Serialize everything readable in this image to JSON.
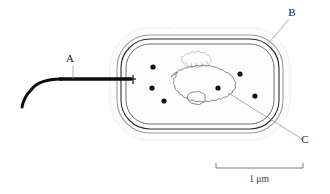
{
  "figure": {
    "background_color": "#ffffff",
    "ink_color": "#1a1a1a"
  },
  "callouts": [
    {
      "id": "A",
      "label": "A",
      "refers_to": "flagellum",
      "label_x": 70,
      "label_y": 62,
      "leader": "M 73 66 L 73 79"
    },
    {
      "id": "B",
      "label": "B",
      "refers_to": "cell-envelope",
      "label_x": 292,
      "label_y": 16,
      "leader": "M 289 19 L 268 44"
    },
    {
      "id": "C",
      "label": "C",
      "refers_to": "nucleoid",
      "label_x": 305,
      "label_y": 143,
      "leader": "M 302 139 L 230 94"
    }
  ],
  "cell": {
    "shape": "rod",
    "layers": [
      {
        "name": "capsule",
        "style": "dotted",
        "color": "#c8c8c8"
      },
      {
        "name": "cell-wall",
        "style": "solid-gray",
        "color": "#9a9a9a"
      },
      {
        "name": "plasma-membrane",
        "style": "solid-dark",
        "color": "#2a2a2a"
      },
      {
        "name": "cytoplasm",
        "style": "solid-thin",
        "color": "#4a4a4a"
      }
    ]
  },
  "ribosomes": {
    "count": 6,
    "color": "#111111",
    "radius": 2.6,
    "points": [
      {
        "x": 153,
        "y": 67
      },
      {
        "x": 152,
        "y": 88
      },
      {
        "x": 164,
        "y": 101
      },
      {
        "x": 240,
        "y": 74
      },
      {
        "x": 218,
        "y": 88
      },
      {
        "x": 255,
        "y": 96
      }
    ]
  },
  "nucleoid": {
    "name": "nucleoid",
    "outline_color": "#6e6e6e"
  },
  "plasmid": {
    "name": "plasmid",
    "outline_color": "#b0b0b0"
  },
  "flagellum": {
    "name": "flagellum",
    "color": "#0d0d0d"
  },
  "scale_bar": {
    "label": "1 μm",
    "x_start": 216,
    "x_end": 303,
    "y": 168,
    "tick_height": 5,
    "label_x": 259,
    "label_y": 182,
    "color": "#6a6a6a"
  }
}
